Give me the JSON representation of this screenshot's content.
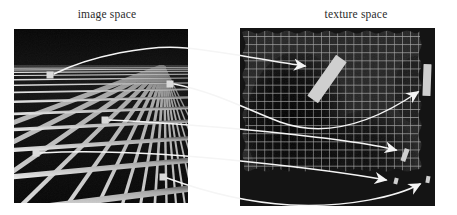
{
  "figure": {
    "kind": "texture-mapping-diagram",
    "width": 457,
    "height": 215,
    "background_color": "#ffffff"
  },
  "captions": {
    "left": "image space",
    "right": "texture space"
  },
  "panels": {
    "image_space": {
      "label": "image space",
      "x": 14,
      "y": 29,
      "width": 174,
      "height": 174,
      "description": "perspective view of an infinite checkerboard grid plane receding to a horizon",
      "sky_color": "#080808",
      "floor_dark_color": "#0b0b0b",
      "grid_line_color": "#c8c8c8",
      "horizon_y_fraction": 0.21,
      "markers": [
        {
          "id": "m1",
          "label": "pixel-footprint-marker-1",
          "x": 50,
          "y": 75,
          "size": 7
        },
        {
          "id": "m2",
          "label": "pixel-footprint-marker-2",
          "x": 170,
          "y": 84,
          "size": 7
        },
        {
          "id": "m3",
          "label": "pixel-footprint-marker-3",
          "x": 105,
          "y": 120,
          "size": 7
        },
        {
          "id": "m4",
          "label": "pixel-footprint-marker-4",
          "x": 36,
          "y": 153,
          "size": 7
        },
        {
          "id": "m5",
          "label": "pixel-footprint-marker-5",
          "x": 163,
          "y": 177,
          "size": 7
        }
      ]
    },
    "texture_space": {
      "label": "texture space",
      "x": 240,
      "y": 28,
      "width": 195,
      "height": 178,
      "description": "flat regular square lattice texture with torn wavy borders and a dark blotch",
      "background_color": "#232323",
      "blotch_color": "#0a0a0a",
      "grid_line_color": "#b9b9b9",
      "grid_columns": 24,
      "grid_rows": 22,
      "cell_size_px": 8,
      "footprints": [
        {
          "id": "f1",
          "label": "texture-footprint-long-tilted",
          "cx": 327,
          "cy": 79,
          "w": 13,
          "h": 50,
          "angle": 35
        },
        {
          "id": "f2",
          "label": "texture-footprint-vertical-bar",
          "cx": 427,
          "cy": 80,
          "w": 8,
          "h": 32,
          "angle": 2
        },
        {
          "id": "f3",
          "label": "texture-footprint-small-slant",
          "cx": 405,
          "cy": 155,
          "w": 5,
          "h": 13,
          "angle": 20
        },
        {
          "id": "f4",
          "label": "texture-footprint-tiny-a",
          "cx": 396,
          "cy": 181,
          "w": 4,
          "h": 6,
          "angle": 15
        },
        {
          "id": "f5",
          "label": "texture-footprint-tiny-b",
          "cx": 428,
          "cy": 179,
          "w": 4,
          "h": 6,
          "angle": 10
        }
      ]
    }
  },
  "mapping_arrows": {
    "color": "#f2f2f2",
    "count": 5,
    "description": "white curved arrows carrying each image-space pixel footprint to its anisotropic footprint in texture space",
    "items": [
      {
        "id": "a1",
        "from": "m1",
        "to": "f1",
        "label": "mapping-arrow-1"
      },
      {
        "id": "a2",
        "from": "m2",
        "to": "f2",
        "label": "mapping-arrow-2"
      },
      {
        "id": "a3",
        "from": "m3",
        "to": "f3",
        "label": "mapping-arrow-3"
      },
      {
        "id": "a4",
        "from": "m4",
        "to": "f4",
        "label": "mapping-arrow-4"
      },
      {
        "id": "a5",
        "from": "m5",
        "to": "f5",
        "label": "mapping-arrow-5"
      }
    ]
  }
}
